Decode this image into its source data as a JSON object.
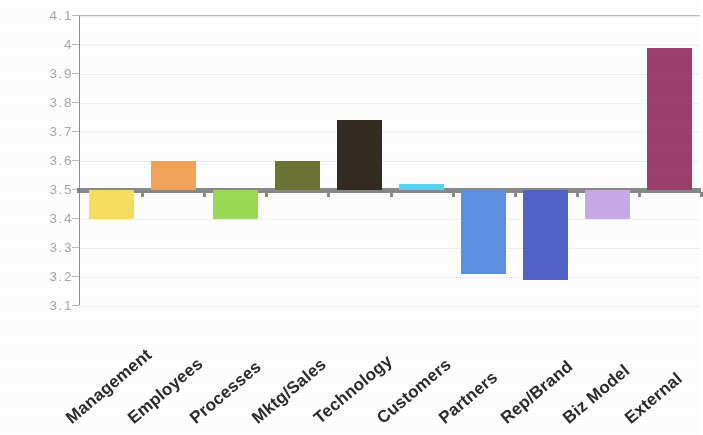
{
  "chart_data": {
    "type": "bar",
    "title": "",
    "subtitle": "",
    "xlabel": "",
    "ylabel": "",
    "ylim": [
      3.1,
      4.1
    ],
    "baseline": 3.5,
    "grid": true,
    "legend": "none",
    "ytick_labels": [
      "4.1",
      "4",
      "3.9",
      "3.8",
      "3.7",
      "3.6",
      "3.5",
      "3.4",
      "3.3",
      "3.2",
      "3.1"
    ],
    "ytick_values": [
      4.1,
      4.0,
      3.9,
      3.8,
      3.7,
      3.6,
      3.5,
      3.4,
      3.3,
      3.2,
      3.1
    ],
    "categories": [
      "Management",
      "Employees",
      "Processes",
      "Mktg/Sales",
      "Technology",
      "Customers",
      "Partners",
      "Rep/Brand",
      "Biz Model",
      "External"
    ],
    "values": [
      3.4,
      3.6,
      3.4,
      3.6,
      3.74,
      3.52,
      3.21,
      3.19,
      3.4,
      3.99
    ],
    "colors": [
      "#f7dd5e",
      "#f0a258",
      "#9ada54",
      "#6b7434",
      "#332a22",
      "#5ed0ef",
      "#5b8fe0",
      "#5162c8",
      "#c9a8e8",
      "#9c3f6c"
    ],
    "bars": [
      {
        "label": "Management",
        "value": 3.4,
        "color": "#f7dd5e",
        "direction": "down"
      },
      {
        "label": "Employees",
        "value": 3.6,
        "color": "#f0a258",
        "direction": "up"
      },
      {
        "label": "Processes",
        "value": 3.4,
        "color": "#9ada54",
        "direction": "down"
      },
      {
        "label": "Mktg/Sales",
        "value": 3.6,
        "color": "#6b7434",
        "direction": "up"
      },
      {
        "label": "Technology",
        "value": 3.74,
        "color": "#332a22",
        "direction": "up"
      },
      {
        "label": "Customers",
        "value": 3.52,
        "color": "#5ed0ef",
        "direction": "up"
      },
      {
        "label": "Partners",
        "value": 3.21,
        "color": "#5b8fe0",
        "direction": "down"
      },
      {
        "label": "Rep/Brand",
        "value": 3.19,
        "color": "#5162c8",
        "direction": "down"
      },
      {
        "label": "Biz Model",
        "value": 3.4,
        "color": "#c9a8e8",
        "direction": "down"
      },
      {
        "label": "External",
        "value": 3.99,
        "color": "#9c3f6c",
        "direction": "up"
      }
    ]
  },
  "axis_style": {
    "axis_line_color": "#777777",
    "grid_color": "#e6e6e6",
    "tick_label_color": "#a6a6a6",
    "category_label_color": "#2b2b2b"
  }
}
